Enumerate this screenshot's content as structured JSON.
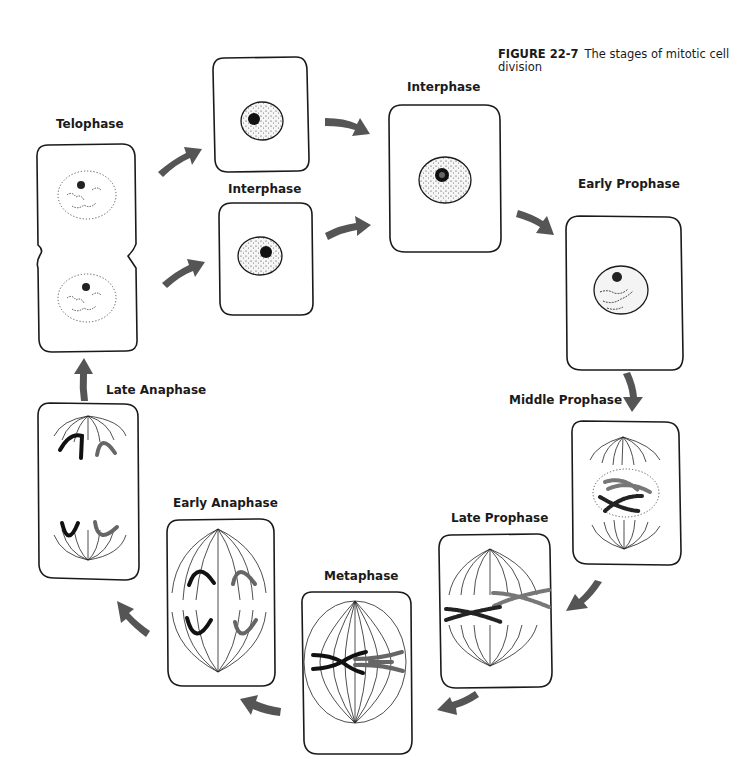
{
  "figure": {
    "number": "FIGURE 22-7",
    "caption": "The stages of mitotic cell division"
  },
  "stages": [
    {
      "id": "interphase-top",
      "label": "Interphase",
      "label_pos": [
        394,
        80
      ],
      "label_visible": true
    },
    {
      "id": "interphase-daughter-top",
      "label": "",
      "label_visible": false
    },
    {
      "id": "interphase-daughter-bottom",
      "label": "Interphase",
      "label_pos": [
        228,
        182
      ],
      "label_visible": true
    },
    {
      "id": "early-prophase",
      "label": "Early Prophase",
      "label_pos": [
        578,
        178
      ]
    },
    {
      "id": "middle-prophase",
      "label": "Middle Prophase",
      "label_pos": [
        509,
        393
      ]
    },
    {
      "id": "late-prophase",
      "label": "Late Prophase",
      "label_pos": [
        451,
        512
      ]
    },
    {
      "id": "metaphase",
      "label": "Metaphase",
      "label_pos": [
        324,
        569
      ]
    },
    {
      "id": "early-anaphase",
      "label": "Early Anaphase",
      "label_pos": [
        173,
        496
      ]
    },
    {
      "id": "late-anaphase",
      "label": "Late Anaphase",
      "label_pos": [
        106,
        383
      ]
    },
    {
      "id": "telophase",
      "label": "Telophase",
      "label_pos": [
        56,
        118
      ]
    }
  ],
  "sequence": [
    "Telophase",
    "Interphase",
    "Interphase",
    "Early Prophase",
    "Middle Prophase",
    "Late Prophase",
    "Metaphase",
    "Early Anaphase",
    "Late Anaphase",
    "Telophase"
  ],
  "colors": {
    "outline": "#1a1a1a",
    "arrow": "#555555",
    "chromatid_dark": "#111111",
    "chromatid_gray": "#666666",
    "background": "#ffffff"
  }
}
